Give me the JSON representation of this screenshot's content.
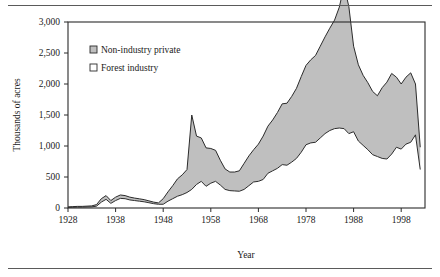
{
  "chart_data": {
    "type": "area",
    "subtype": "stacked-area",
    "title": "",
    "xlabel": "Year",
    "ylabel": "Thousands of acres",
    "xlim": [
      1928,
      2003
    ],
    "ylim": [
      0,
      3000
    ],
    "xticks": [
      1928,
      1938,
      1948,
      1958,
      1968,
      1978,
      1988,
      1998
    ],
    "xtick_labels": [
      "1928",
      "1938",
      "1948",
      "1958",
      "1968",
      "1978",
      "1988",
      "1998"
    ],
    "yticks": [
      0,
      500,
      1000,
      1500,
      2000,
      2500,
      3000
    ],
    "ytick_labels": [
      "0",
      "500",
      "1,000",
      "1,500",
      "2,000",
      "2,500",
      "3,000"
    ],
    "grid": false,
    "legend_position": "upper-left-inside",
    "legend": [
      {
        "label": "Non-industry private",
        "swatch": "gray-filled",
        "color": "#b8b8b8"
      },
      {
        "label": "Forest industry",
        "swatch": "white-filled",
        "color": "#ffffff"
      }
    ],
    "x": [
      1928,
      1929,
      1930,
      1931,
      1932,
      1933,
      1934,
      1935,
      1936,
      1937,
      1938,
      1939,
      1940,
      1941,
      1942,
      1943,
      1944,
      1945,
      1946,
      1947,
      1948,
      1949,
      1950,
      1951,
      1952,
      1953,
      1954,
      1955,
      1956,
      1957,
      1958,
      1959,
      1960,
      1961,
      1962,
      1963,
      1964,
      1965,
      1966,
      1967,
      1968,
      1969,
      1970,
      1971,
      1972,
      1973,
      1974,
      1975,
      1976,
      1977,
      1978,
      1979,
      1980,
      1981,
      1982,
      1983,
      1984,
      1985,
      1986,
      1987,
      1988,
      1989,
      1990,
      1991,
      1992,
      1993,
      1994,
      1995,
      1996,
      1997,
      1998,
      1999,
      2000,
      2001,
      2002
    ],
    "series": [
      {
        "name": "Forest industry",
        "values": [
          10,
          12,
          14,
          14,
          16,
          18,
          30,
          95,
          140,
          75,
          120,
          155,
          150,
          130,
          120,
          110,
          100,
          85,
          70,
          60,
          60,
          110,
          150,
          190,
          215,
          250,
          300,
          380,
          430,
          350,
          400,
          430,
          370,
          300,
          280,
          275,
          270,
          300,
          360,
          420,
          430,
          460,
          560,
          600,
          640,
          700,
          690,
          740,
          800,
          900,
          1020,
          1050,
          1060,
          1130,
          1200,
          1250,
          1280,
          1290,
          1280,
          1200,
          1230,
          1080,
          1010,
          940,
          860,
          830,
          800,
          790,
          870,
          980,
          950,
          1030,
          1060,
          1180,
          620
        ]
      },
      {
        "name": "Non-industry private",
        "values": [
          8,
          10,
          12,
          12,
          14,
          16,
          25,
          55,
          60,
          45,
          55,
          55,
          50,
          45,
          40,
          38,
          35,
          30,
          25,
          22,
          90,
          150,
          210,
          280,
          320,
          370,
          1200,
          780,
          700,
          620,
          560,
          500,
          400,
          330,
          300,
          305,
          330,
          420,
          480,
          520,
          600,
          700,
          760,
          820,
          900,
          980,
          1000,
          1060,
          1130,
          1220,
          1280,
          1340,
          1400,
          1480,
          1560,
          1650,
          1750,
          1950,
          2300,
          2050,
          1380,
          1230,
          1130,
          1080,
          1020,
          980,
          1140,
          1240,
          1300,
          1130,
          1050,
          1080,
          1120,
          820,
          360
        ]
      }
    ],
    "totals_note": "Upper boundary is the sum of Forest industry plus Non-industry private.",
    "notable_features": [
      {
        "year": 1954,
        "description": "sharp spike in total to about 1,500"
      },
      {
        "year": 1988,
        "description": "peak total of about 2,580"
      },
      {
        "year": 1997,
        "description": "secondary peak of about 2,170"
      },
      {
        "year": 2002,
        "description": "sharp decline to about 620"
      }
    ]
  },
  "figure": {
    "rule_top": "horizontal-rule",
    "rule_bottom": "horizontal-rule"
  }
}
